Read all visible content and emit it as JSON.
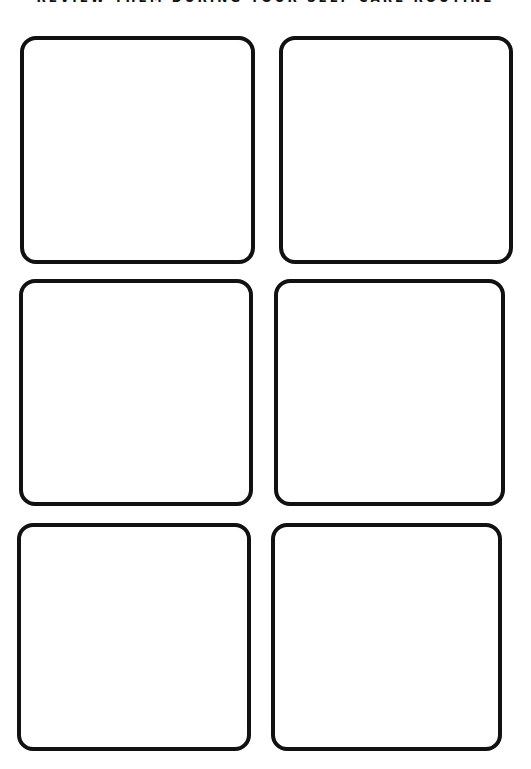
{
  "header": {
    "text": "REVIEW THEM DURING YOUR SELF CARE ROUTINE"
  },
  "boxes": [
    {
      "label": ""
    },
    {
      "label": ""
    },
    {
      "label": ""
    },
    {
      "label": ""
    },
    {
      "label": ""
    },
    {
      "label": ""
    }
  ],
  "colors": {
    "border": "#111111",
    "background": "#ffffff"
  }
}
